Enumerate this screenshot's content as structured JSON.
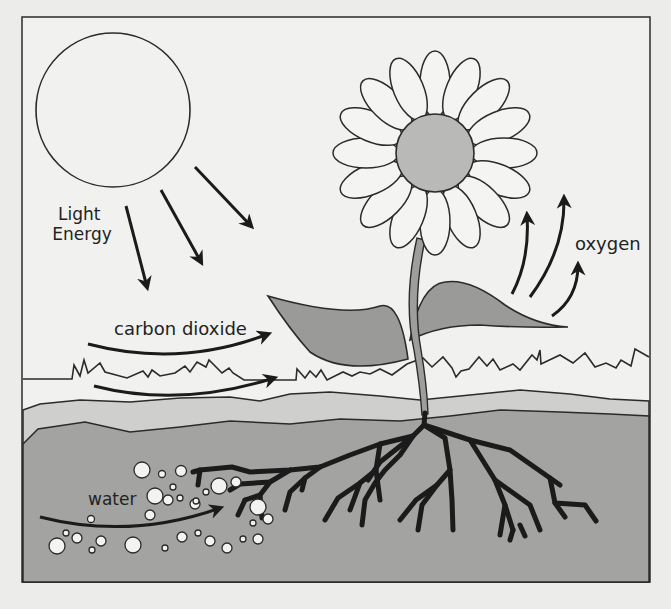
{
  "diagram": {
    "labels": {
      "light_line1": "Light",
      "light_line2": "Energy",
      "carbon_dioxide": "carbon dioxide",
      "oxygen": "oxygen",
      "water": "water"
    },
    "elements": {
      "sun": "sun",
      "flower": "flower",
      "leaves": "leaves",
      "stem": "stem",
      "roots": "roots",
      "ground_surface": "grass line",
      "soil": "soil",
      "water_bubbles": "water droplets"
    },
    "colors": {
      "background": "#ececea",
      "panel": "#f1f1ef",
      "outline": "#2b2b2b",
      "leaf": "#9a9a98",
      "flower_center": "#b9b9b7",
      "topsoil": "#cfcfcd",
      "soil": "#a3a3a1",
      "stem": "#9e9e9c"
    }
  }
}
